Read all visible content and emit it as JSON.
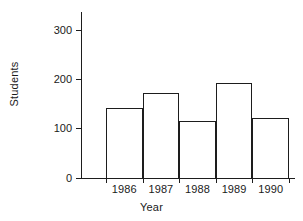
{
  "chart_data": {
    "type": "bar",
    "title": "",
    "xlabel": "Year",
    "ylabel": "Students",
    "categories": [
      "1986",
      "1987",
      "1988",
      "1989",
      "1990"
    ],
    "values": [
      140,
      170,
      115,
      190,
      120
    ],
    "ylim": [
      0,
      330
    ],
    "yticks": [
      0,
      100,
      200,
      300
    ],
    "ytick_labels": [
      "0",
      "100",
      "200",
      "300"
    ],
    "grid": false,
    "legend": null,
    "bar_fill": "#ffffff",
    "bar_edge_color": "#1d1d1d",
    "axis_color": "#1d1d1d",
    "background": "#ffffff"
  }
}
